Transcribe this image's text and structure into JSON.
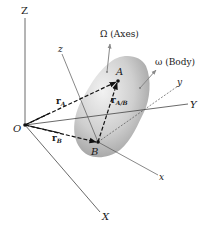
{
  "diagram": {
    "labels": {
      "Z": "Z",
      "X": "X",
      "Y": "Y",
      "O": "O",
      "z": "z",
      "y": "y",
      "x": "x",
      "A": "A",
      "B": "B",
      "rA_main": "r",
      "rA_sub": "A",
      "rB_main": "r",
      "rB_sub": "B",
      "rAB_main": "r",
      "rAB_sub": "A/B",
      "Omega": "Ω (Axes)",
      "omega": "ω (Body)"
    },
    "colors": {
      "line": "#333333",
      "thin_line": "#555555",
      "body_light": "#e4e4e4",
      "body_dark": "#9a9a9a",
      "arrow_gray": "#8a8a8a"
    }
  }
}
